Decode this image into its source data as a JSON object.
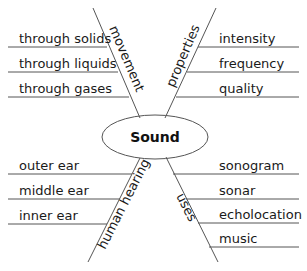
{
  "center": {
    "label": "Sound"
  },
  "branches": [
    {
      "label": "movement",
      "details": [
        "through solids",
        "through liquids",
        "through gases"
      ]
    },
    {
      "label": "properties",
      "details": [
        "intensity",
        "frequency",
        "quality"
      ]
    },
    {
      "label": "human hearing",
      "details": [
        "outer ear",
        "middle ear",
        "inner ear"
      ]
    },
    {
      "label": "uses",
      "details": [
        "sonogram",
        "sonar",
        "echolocation",
        "music"
      ]
    }
  ],
  "colors": {
    "line": "#555555",
    "text": "#1a1a1a"
  }
}
